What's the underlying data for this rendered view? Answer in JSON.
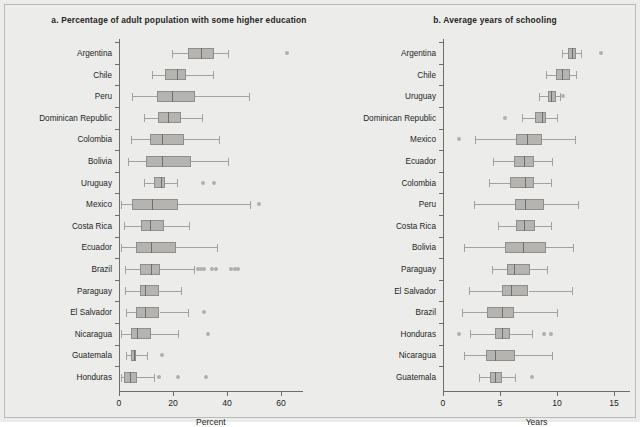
{
  "figure": {
    "background_color": "#ececeb",
    "box_fill_color": "#b5b4b1",
    "box_edge_color": "#8f8e8b",
    "whisker_color": "#a2a19e",
    "median_color": "#6f6e6c",
    "outlier_color": "#b0afac"
  },
  "chart_data": [
    {
      "type": "boxplot",
      "panel": "a",
      "title": "a. Percentage of adult population with some higher education",
      "xlabel": "Percent",
      "ylabel": "",
      "xlim": [
        -2,
        68
      ],
      "xticks": [
        0,
        20,
        40,
        60
      ],
      "xticklabels": [
        "0",
        "20",
        "40",
        "60"
      ],
      "grid": false,
      "orientation": "horizontal",
      "categories": [
        "Argentina",
        "Chile",
        "Peru",
        "Dominican Republic",
        "Colombia",
        "Bolivia",
        "Uruguay",
        "Mexico",
        "Costa Rica",
        "Ecuador",
        "Brazil",
        "Paraguay",
        "El Salvador",
        "Nicaragua",
        "Guatemala",
        "Honduras"
      ],
      "boxes": [
        {
          "category": "Argentina",
          "whisker_low": 19.6,
          "q1": 25.5,
          "median": 30.4,
          "q3": 35.2,
          "whisker_high": 40.4,
          "outliers": [
            62.4
          ]
        },
        {
          "category": "Chile",
          "whisker_low": 12.2,
          "q1": 17.0,
          "median": 21.5,
          "q3": 24.8,
          "whisker_high": 34.8,
          "outliers": []
        },
        {
          "category": "Peru",
          "whisker_low": 4.8,
          "q1": 14.0,
          "median": 19.8,
          "q3": 28.0,
          "whisker_high": 48.0,
          "outliers": []
        },
        {
          "category": "Dominican Republic",
          "whisker_low": 9.2,
          "q1": 14.6,
          "median": 18.0,
          "q3": 22.8,
          "whisker_high": 30.6,
          "outliers": []
        },
        {
          "category": "Colombia",
          "whisker_low": 4.6,
          "q1": 11.4,
          "median": 15.8,
          "q3": 24.2,
          "whisker_high": 37.2,
          "outliers": []
        },
        {
          "category": "Bolivia",
          "whisker_low": 3.4,
          "q1": 10.0,
          "median": 16.0,
          "q3": 26.8,
          "whisker_high": 40.2,
          "outliers": []
        },
        {
          "category": "Uruguay",
          "whisker_low": 9.4,
          "q1": 12.8,
          "median": 15.4,
          "q3": 17.0,
          "whisker_high": 21.4,
          "outliers": [
            31.2,
            35.0
          ]
        },
        {
          "category": "Mexico",
          "whisker_low": 0.6,
          "q1": 4.8,
          "median": 12.4,
          "q3": 22.0,
          "whisker_high": 48.6,
          "outliers": [
            51.8
          ]
        },
        {
          "category": "Costa Rica",
          "whisker_low": 2.0,
          "q1": 8.2,
          "median": 11.6,
          "q3": 16.8,
          "whisker_high": 26.0,
          "outliers": []
        },
        {
          "category": "Ecuador",
          "whisker_low": 0.6,
          "q1": 6.4,
          "median": 11.8,
          "q3": 21.0,
          "whisker_high": 36.4,
          "outliers": []
        },
        {
          "category": "Brazil",
          "whisker_low": 2.2,
          "q1": 7.6,
          "median": 11.8,
          "q3": 15.2,
          "whisker_high": 27.8,
          "outliers": [
            29.2,
            30.4,
            31.6,
            34.4,
            35.8,
            41.6,
            43.0,
            44.2
          ]
        },
        {
          "category": "Paraguay",
          "whisker_low": 2.2,
          "q1": 7.6,
          "median": 9.8,
          "q3": 14.8,
          "whisker_high": 23.0,
          "outliers": []
        },
        {
          "category": "El Salvador",
          "whisker_low": 2.6,
          "q1": 6.2,
          "median": 9.6,
          "q3": 15.0,
          "whisker_high": 25.4,
          "outliers": [
            31.6
          ]
        },
        {
          "category": "Nicaragua",
          "whisker_low": 0.8,
          "q1": 4.4,
          "median": 6.6,
          "q3": 12.0,
          "whisker_high": 22.0,
          "outliers": [
            33.0
          ]
        },
        {
          "category": "Guatemala",
          "whisker_low": 2.6,
          "q1": 4.4,
          "median": 5.6,
          "q3": 6.4,
          "whisker_high": 10.4,
          "outliers": [
            15.8
          ]
        },
        {
          "category": "Honduras",
          "whisker_low": 0.6,
          "q1": 2.0,
          "median": 4.0,
          "q3": 6.8,
          "whisker_high": 12.8,
          "outliers": [
            14.8,
            21.8,
            32.4
          ]
        }
      ]
    },
    {
      "type": "boxplot",
      "panel": "b",
      "title": "b. Average years of schooling",
      "xlabel": "Years",
      "ylabel": "",
      "xlim": [
        -0.6,
        16.4
      ],
      "xticks": [
        0,
        5,
        10,
        15
      ],
      "xticklabels": [
        "0",
        "5",
        "10",
        "15"
      ],
      "grid": false,
      "orientation": "horizontal",
      "categories": [
        "Argentina",
        "Chile",
        "Uruguay",
        "Dominican Republic",
        "Mexico",
        "Ecuador",
        "Colombia",
        "Peru",
        "Costa Rica",
        "Bolivia",
        "Paraguay",
        "El Salvador",
        "Brazil",
        "Honduras",
        "Nicaragua",
        "Guatemala"
      ],
      "boxes": [
        {
          "category": "Argentina",
          "whisker_low": 10.4,
          "q1": 11.0,
          "median": 11.3,
          "q3": 11.7,
          "whisker_high": 12.1,
          "outliers": [
            13.9
          ]
        },
        {
          "category": "Chile",
          "whisker_low": 9.0,
          "q1": 9.9,
          "median": 10.4,
          "q3": 11.1,
          "whisker_high": 11.7,
          "outliers": []
        },
        {
          "category": "Uruguay",
          "whisker_low": 8.4,
          "q1": 9.2,
          "median": 9.5,
          "q3": 9.9,
          "whisker_high": 10.3,
          "outliers": [
            10.5
          ]
        },
        {
          "category": "Dominican Republic",
          "whisker_low": 6.9,
          "q1": 8.1,
          "median": 8.7,
          "q3": 9.0,
          "whisker_high": 10.0,
          "outliers": [
            5.4
          ]
        },
        {
          "category": "Mexico",
          "whisker_low": 2.8,
          "q1": 6.4,
          "median": 7.4,
          "q3": 8.7,
          "whisker_high": 11.6,
          "outliers": [
            1.4
          ]
        },
        {
          "category": "Ecuador",
          "whisker_low": 4.4,
          "q1": 6.2,
          "median": 7.1,
          "q3": 8.0,
          "whisker_high": 9.6,
          "outliers": []
        },
        {
          "category": "Colombia",
          "whisker_low": 4.0,
          "q1": 5.9,
          "median": 7.2,
          "q3": 8.0,
          "whisker_high": 9.5,
          "outliers": []
        },
        {
          "category": "Peru",
          "whisker_low": 2.7,
          "q1": 6.3,
          "median": 7.2,
          "q3": 8.9,
          "whisker_high": 11.8,
          "outliers": []
        },
        {
          "category": "Costa Rica",
          "whisker_low": 4.8,
          "q1": 6.4,
          "median": 7.1,
          "q3": 8.1,
          "whisker_high": 9.5,
          "outliers": []
        },
        {
          "category": "Bolivia",
          "whisker_low": 1.8,
          "q1": 5.4,
          "median": 7.0,
          "q3": 9.0,
          "whisker_high": 11.4,
          "outliers": []
        },
        {
          "category": "Paraguay",
          "whisker_low": 4.3,
          "q1": 5.6,
          "median": 6.2,
          "q3": 7.6,
          "whisker_high": 9.1,
          "outliers": []
        },
        {
          "category": "El Salvador",
          "whisker_low": 2.3,
          "q1": 5.2,
          "median": 6.0,
          "q3": 7.5,
          "whisker_high": 11.3,
          "outliers": []
        },
        {
          "category": "Brazil",
          "whisker_low": 1.7,
          "q1": 3.9,
          "median": 5.2,
          "q3": 6.2,
          "whisker_high": 10.0,
          "outliers": []
        },
        {
          "category": "Honduras",
          "whisker_low": 2.4,
          "q1": 4.6,
          "median": 5.2,
          "q3": 5.9,
          "whisker_high": 7.8,
          "outliers": [
            1.4,
            8.9,
            9.5
          ]
        },
        {
          "category": "Nicaragua",
          "whisker_low": 1.8,
          "q1": 3.8,
          "median": 4.6,
          "q3": 6.3,
          "whisker_high": 9.6,
          "outliers": []
        },
        {
          "category": "Guatemala",
          "whisker_low": 3.2,
          "q1": 4.1,
          "median": 4.6,
          "q3": 5.2,
          "whisker_high": 6.3,
          "outliers": [
            7.8
          ]
        }
      ]
    }
  ]
}
